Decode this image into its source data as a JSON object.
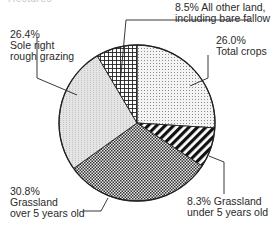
{
  "header": {
    "cut_off_title": "Hectares"
  },
  "chart_data": {
    "type": "pie",
    "title": "",
    "start_angle_deg": 0,
    "direction": "clockwise",
    "slices": [
      {
        "label": "Total crops",
        "value": 26.0,
        "pct_text": "26.0%",
        "pattern": "fine-dots"
      },
      {
        "label": "Grassland under 5 years old",
        "value": 8.3,
        "pct_text": "8.3%",
        "pattern": "diagonal-stripes"
      },
      {
        "label": "Grassland over 5 years old",
        "value": 30.8,
        "pct_text": "30.8%",
        "pattern": "checker"
      },
      {
        "label": "Sole right rough grazing",
        "value": 26.4,
        "pct_text": "26.4%",
        "pattern": "light-stipple"
      },
      {
        "label": "All other land, including bare fallow",
        "value": 8.5,
        "pct_text": "8.5%",
        "pattern": "grid"
      }
    ],
    "legend": "none (callout labels)"
  },
  "labels": {
    "crops": {
      "pct": "26.0%",
      "line1": "Total crops"
    },
    "grass_under": {
      "line1": "8.3% Grassland",
      "line2": "under 5 years old"
    },
    "grass_over": {
      "pct": "30.8%",
      "line1": "Grassland",
      "line2": "over 5 years old"
    },
    "rough": {
      "pct": "26.4%",
      "line1": "Sole right",
      "line2": "rough grazing"
    },
    "other": {
      "line1": "8.5% All other land,",
      "line2": "including bare fallow"
    }
  }
}
